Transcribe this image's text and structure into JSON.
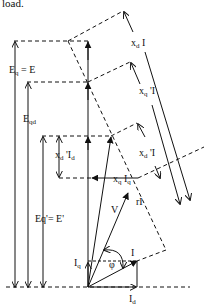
{
  "caption_fragment": "load.",
  "diagram": {
    "labels": {
      "eq_e": "Eq = E",
      "eqd": "Eqd",
      "eq_prime": "Eq'= E'",
      "xd_I": "xd I",
      "xq_prime_I": "xq'I",
      "xd_prime_I": "xd'I",
      "xd_prime_Id": "xd'Id",
      "xq_Iq": "xq Iq",
      "V": "V",
      "rI": "rI",
      "I": "I",
      "phi": "φ",
      "Iq": "Iq",
      "Id": "Id"
    },
    "colors": {
      "line": "#111111",
      "background": "#ffffff"
    }
  }
}
